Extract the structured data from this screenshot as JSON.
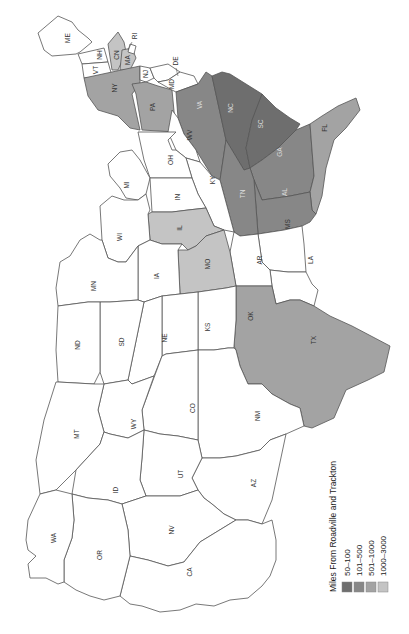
{
  "map": {
    "orientation": "rotated-90-clockwise",
    "legend": {
      "title": "Miles From Roadville and Trackton",
      "items": [
        {
          "label": "50–100",
          "color": "#6e6e6e"
        },
        {
          "label": "101–500",
          "color": "#878787"
        },
        {
          "label": "501–1000",
          "color": "#a3a3a3"
        },
        {
          "label": "1000–3000",
          "color": "#c4c4c4"
        }
      ]
    },
    "colors": {
      "none": "#ffffff",
      "c50_100": "#6e6e6e",
      "c101_500": "#878787",
      "c501_1000": "#a3a3a3",
      "c1000_3000": "#c4c4c4",
      "border": "#555555"
    },
    "states": {
      "ME": {
        "label": "ME",
        "category": "none"
      },
      "NH": {
        "label": "NH",
        "category": "none"
      },
      "VT": {
        "label": "VT",
        "category": "none"
      },
      "MA": {
        "label": "MA",
        "category": "1000–3000"
      },
      "CT": {
        "label": "CN",
        "category": "1000–3000"
      },
      "RI": {
        "label": "RI",
        "category": "none"
      },
      "NY": {
        "label": "NY",
        "category": "501–1000"
      },
      "NJ": {
        "label": "NJ",
        "category": "none"
      },
      "PA": {
        "label": "PA",
        "category": "501–1000"
      },
      "DE": {
        "label": "DE",
        "category": "none"
      },
      "MD": {
        "label": "MD",
        "category": "none"
      },
      "VA": {
        "label": "VA",
        "category": "101–500"
      },
      "WV": {
        "label": "WV",
        "category": "none"
      },
      "NC": {
        "label": "NC",
        "category": "50–100"
      },
      "SC": {
        "label": "SC",
        "category": "50–100"
      },
      "GA": {
        "label": "GA",
        "category": "101–500"
      },
      "FL": {
        "label": "FL",
        "category": "501–1000"
      },
      "AL": {
        "label": "AL",
        "category": "101–500"
      },
      "TN": {
        "label": "TN",
        "category": "101–500"
      },
      "KY": {
        "label": "KY",
        "category": "none"
      },
      "OH": {
        "label": "OH",
        "category": "none"
      },
      "MI": {
        "label": "MI",
        "category": "none"
      },
      "IN": {
        "label": "IN",
        "category": "none"
      },
      "IL": {
        "label": "IL",
        "category": "1000–3000"
      },
      "WI": {
        "label": "WI",
        "category": "none"
      },
      "MS": {
        "label": "MS",
        "category": "none"
      },
      "LA": {
        "label": "LA",
        "category": "none"
      },
      "AR": {
        "label": "AR",
        "category": "none"
      },
      "MO": {
        "label": "MO",
        "category": "1000–3000"
      },
      "IA": {
        "label": "IA",
        "category": "none"
      },
      "MN": {
        "label": "MN",
        "category": "none"
      },
      "TX": {
        "label": "TX",
        "category": "501–1000"
      },
      "OK": {
        "label": "OK",
        "category": "none"
      },
      "KS": {
        "label": "KS",
        "category": "none"
      },
      "NE": {
        "label": "NE",
        "category": "none"
      },
      "SD": {
        "label": "SD",
        "category": "none"
      },
      "ND": {
        "label": "ND",
        "category": "none"
      },
      "NM": {
        "label": "NM",
        "category": "none"
      },
      "CO": {
        "label": "CO",
        "category": "none"
      },
      "WY": {
        "label": "WY",
        "category": "none"
      },
      "MT": {
        "label": "MT",
        "category": "none"
      },
      "AZ": {
        "label": "AZ",
        "category": "none"
      },
      "UT": {
        "label": "UT",
        "category": "none"
      },
      "ID": {
        "label": "ID",
        "category": "none"
      },
      "NV": {
        "label": "NV",
        "category": "none"
      },
      "CA": {
        "label": "CA",
        "category": "none"
      },
      "OR": {
        "label": "OR",
        "category": "none"
      },
      "WA": {
        "label": "WA",
        "category": "none"
      }
    }
  }
}
